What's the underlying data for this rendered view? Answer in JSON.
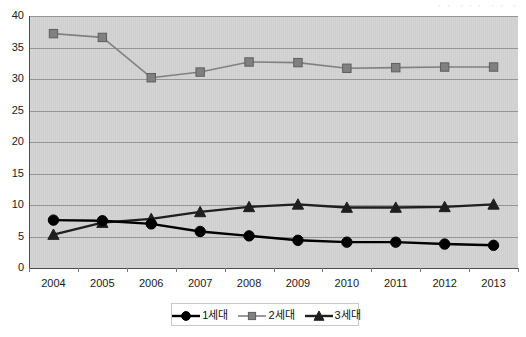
{
  "caption": {
    "top_right_faint": "・・ ・・・ ・・ ・"
  },
  "chart_data": {
    "type": "line",
    "title": "",
    "subtitle": "",
    "xlabel": "",
    "ylabel": "",
    "x": [
      "2004",
      "2005",
      "2006",
      "2007",
      "2008",
      "2009",
      "2010",
      "2011",
      "2012",
      "2013"
    ],
    "categories": [
      "2004",
      "2005",
      "2006",
      "2007",
      "2008",
      "2009",
      "2010",
      "2011",
      "2012",
      "2013"
    ],
    "ylim": [
      0,
      40
    ],
    "yticks": [
      "0",
      "5",
      "10",
      "15",
      "20",
      "25",
      "30",
      "35",
      "40"
    ],
    "ytick_values": [
      0,
      5,
      10,
      15,
      20,
      25,
      30,
      35,
      40
    ],
    "grid": true,
    "grid_axis": "y",
    "legend_position": "bottom",
    "plot_background": "#d4d4d4",
    "grid_color": "#8c8c8c",
    "series": [
      {
        "name": "1세대",
        "marker": "circle",
        "color": "#000000",
        "values": [
          7.6,
          7.5,
          7.0,
          5.8,
          5.1,
          4.4,
          4.1,
          4.1,
          3.8,
          3.6
        ]
      },
      {
        "name": "2세대",
        "marker": "square",
        "color": "#808080",
        "values": [
          37.2,
          36.6,
          30.2,
          31.1,
          32.7,
          32.6,
          31.7,
          31.8,
          31.9,
          31.9
        ]
      },
      {
        "name": "3세대",
        "marker": "triangle",
        "color": "#1f1f1f",
        "values": [
          5.3,
          7.2,
          7.8,
          8.9,
          9.7,
          10.1,
          9.6,
          9.6,
          9.7,
          10.1
        ]
      }
    ]
  }
}
